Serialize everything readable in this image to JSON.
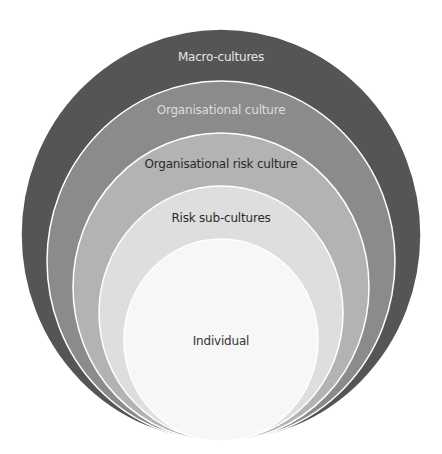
{
  "diagram": {
    "type": "nested-circles",
    "layers": [
      {
        "label": "Macro-cultures",
        "fill": "#555555",
        "text_color": "#e6e6e6",
        "cx": 221,
        "cy": 235,
        "rx": 200,
        "ry": 206,
        "label_y": 50
      },
      {
        "label": "Organisational culture",
        "fill": "#8b8b8b",
        "text_color": "#dddddd",
        "cx": 221,
        "cy": 261,
        "rx": 174,
        "ry": 180,
        "label_y": 103
      },
      {
        "label": "Organisational risk culture",
        "fill": "#b3b3b3",
        "text_color": "#2a2a2a",
        "cx": 221,
        "cy": 287,
        "rx": 148,
        "ry": 154,
        "label_y": 157
      },
      {
        "label": "Risk sub-cultures",
        "fill": "#dedede",
        "text_color": "#2a2a2a",
        "cx": 221,
        "cy": 313,
        "rx": 122,
        "ry": 127,
        "label_y": 211
      },
      {
        "label": "Individual",
        "fill": "#f7f7f7",
        "text_color": "#333333",
        "cx": 221,
        "cy": 340,
        "rx": 97,
        "ry": 101,
        "label_y": 334
      }
    ]
  }
}
